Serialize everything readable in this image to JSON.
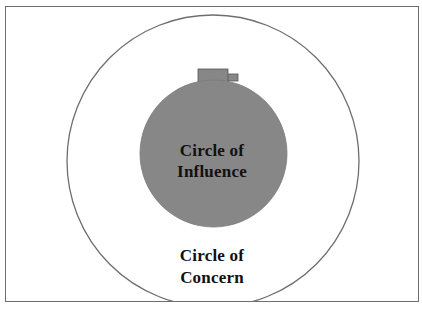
{
  "diagram": {
    "outer_circle": {
      "label_line1": "Circle of",
      "label_line2": "Concern",
      "fill": "#ffffff",
      "stroke": "#6e6e6e"
    },
    "inner_circle": {
      "label_line1": "Circle of",
      "label_line2": "Influence",
      "fill": "#878787",
      "stroke": "#7a7a7a"
    },
    "knob": {
      "fill": "#878787",
      "stroke": "#555555"
    },
    "frame_color": "#6e6e6e"
  }
}
